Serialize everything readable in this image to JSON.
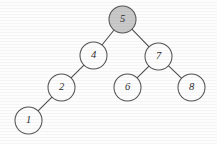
{
  "diagram": {
    "background_color": "#fdfdfd",
    "node_outline_color": "#555555",
    "edge_color": "#4a4a4a",
    "highlight_fill_color": "#c9c9c9",
    "default_fill_color": "#fdfdfd",
    "node_radius": 13.5,
    "nodes": [
      {
        "id": "n5",
        "label": "5",
        "cx": 122.5,
        "cy": 19.5,
        "r": 13.5,
        "fill": "gray",
        "highlighted": true
      },
      {
        "id": "n4",
        "label": "4",
        "cx": 93.5,
        "cy": 55.5,
        "r": 13.5,
        "fill": "white",
        "highlighted": false
      },
      {
        "id": "n7",
        "label": "7",
        "cx": 158.5,
        "cy": 56.5,
        "r": 13.5,
        "fill": "white",
        "highlighted": false
      },
      {
        "id": "n2",
        "label": "2",
        "cx": 61.5,
        "cy": 87.5,
        "r": 13.5,
        "fill": "white",
        "highlighted": false
      },
      {
        "id": "n6",
        "label": "6",
        "cx": 127.5,
        "cy": 87.5,
        "r": 13.5,
        "fill": "white",
        "highlighted": false
      },
      {
        "id": "n8",
        "label": "8",
        "cx": 191.5,
        "cy": 87.5,
        "r": 13.5,
        "fill": "white",
        "highlighted": false
      },
      {
        "id": "n1",
        "label": "1",
        "cx": 28.5,
        "cy": 120.5,
        "r": 13.5,
        "fill": "white",
        "highlighted": false
      }
    ],
    "edges": [
      {
        "id": "e5-4",
        "from": "n5",
        "to": "n4",
        "from_label": "5",
        "to_label": "4"
      },
      {
        "id": "e5-7",
        "from": "n5",
        "to": "n7",
        "from_label": "5",
        "to_label": "7"
      },
      {
        "id": "e4-2",
        "from": "n4",
        "to": "n2",
        "from_label": "4",
        "to_label": "2"
      },
      {
        "id": "e2-1",
        "from": "n2",
        "to": "n1",
        "from_label": "2",
        "to_label": "1"
      },
      {
        "id": "e7-6",
        "from": "n7",
        "to": "n6",
        "from_label": "7",
        "to_label": "6"
      },
      {
        "id": "e7-8",
        "from": "n7",
        "to": "n8",
        "from_label": "8",
        "to_label": "8"
      }
    ]
  }
}
